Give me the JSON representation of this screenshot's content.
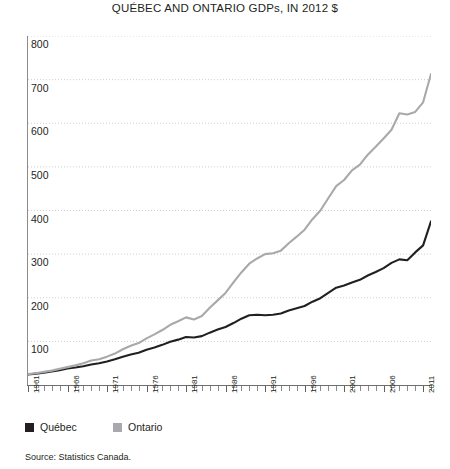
{
  "chart_data": {
    "type": "line",
    "title": "QUÉBEC AND ONTARIO GDPs, IN 2012 $",
    "xlabel": "",
    "ylabel": "",
    "ylim": [
      0,
      800
    ],
    "xlim": [
      1961,
      2012
    ],
    "grid": true,
    "legend_position": "bottom-left",
    "y_ticks": [
      800,
      700,
      600,
      500,
      400,
      300,
      200,
      100
    ],
    "x_ticks": [
      1961,
      1966,
      1971,
      1976,
      1981,
      1986,
      1991,
      1996,
      2001,
      2006,
      2011
    ],
    "x": [
      1961,
      1962,
      1963,
      1964,
      1965,
      1966,
      1967,
      1968,
      1969,
      1970,
      1971,
      1972,
      1973,
      1974,
      1975,
      1976,
      1977,
      1978,
      1979,
      1980,
      1981,
      1982,
      1983,
      1984,
      1985,
      1986,
      1987,
      1988,
      1989,
      1990,
      1991,
      1992,
      1993,
      1994,
      1995,
      1996,
      1997,
      1998,
      1999,
      2000,
      2001,
      2002,
      2003,
      2004,
      2005,
      2006,
      2007,
      2008,
      2009,
      2010,
      2011,
      2012
    ],
    "series": [
      {
        "name": "Québec",
        "color": "#231f20",
        "values": [
          24,
          26,
          28,
          31,
          34,
          38,
          40,
          43,
          47,
          50,
          54,
          59,
          65,
          70,
          74,
          81,
          86,
          92,
          99,
          104,
          110,
          109,
          112,
          120,
          127,
          133,
          142,
          152,
          160,
          161,
          160,
          161,
          164,
          171,
          176,
          181,
          191,
          199,
          211,
          223,
          228,
          235,
          241,
          251,
          259,
          268,
          280,
          288,
          286,
          304,
          320,
          375
        ]
      },
      {
        "name": "Ontario",
        "color": "#a7a9ac",
        "values": [
          25,
          27,
          30,
          33,
          37,
          41,
          45,
          50,
          56,
          59,
          65,
          72,
          82,
          90,
          96,
          107,
          116,
          126,
          138,
          146,
          155,
          150,
          158,
          177,
          194,
          211,
          235,
          258,
          278,
          290,
          300,
          302,
          308,
          325,
          340,
          356,
          380,
          400,
          428,
          456,
          470,
          492,
          505,
          528,
          546,
          565,
          585,
          623,
          620,
          626,
          648,
          713
        ]
      }
    ],
    "annotations": []
  },
  "legend": {
    "items": [
      {
        "label": "Québec",
        "color": "#231f20"
      },
      {
        "label": "Ontario",
        "color": "#a7a9ac"
      }
    ]
  },
  "source": {
    "text": "Source: Statistics Canada."
  }
}
